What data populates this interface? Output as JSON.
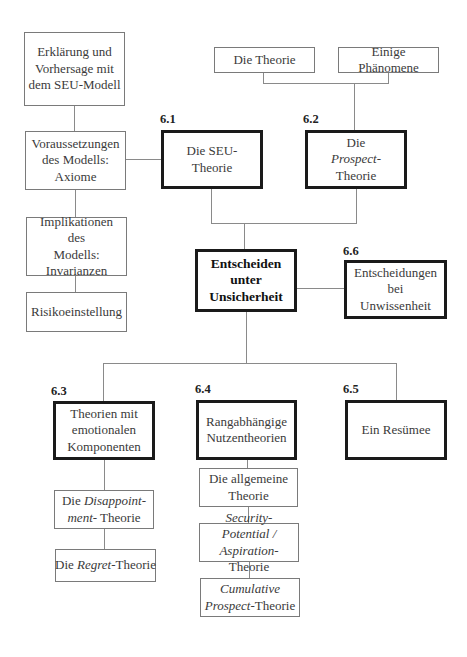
{
  "diagram": {
    "center": {
      "label_lines": [
        "Entscheiden",
        "unter",
        "Unsicherheit"
      ]
    },
    "sections": [
      {
        "number": "6.1",
        "label": "Die SEU-Theorie",
        "subtopics": [
          "Erklärung und Vorhersage mit dem SEU-Modell",
          "Voraussetzungen des Modells: Axiome",
          "Implikationen des Modells: Invarianzen",
          "Risikoeinstellung"
        ]
      },
      {
        "number": "6.2",
        "label_plain_1": "Die",
        "label_italic": "Prospect",
        "label_plain_2": "-Theorie",
        "subtopics": [
          "Die Theorie",
          "Einige Phänomene"
        ]
      },
      {
        "number": "6.3",
        "label": "Theorien mit emotionalen Komponenten",
        "subtopics": [
          "Die Disappointment- Theorie",
          "Die Regret-Theorie"
        ]
      },
      {
        "number": "6.4",
        "label": "Rangabhängige Nutzentheorien",
        "subtopics": [
          "Die allgemeine Theorie",
          "Security-Potential / Aspiration-Theorie",
          "Cumulative Prospect-Theorie"
        ]
      },
      {
        "number": "6.5",
        "label": "Ein Resümee",
        "subtopics": []
      },
      {
        "number": "6.6",
        "label": "Entscheidungen bei Unwissenheit",
        "subtopics": []
      }
    ]
  },
  "text": {
    "erklaerung_1": "Erklärung und",
    "erklaerung_2": "Vorhersage mit",
    "erklaerung_3": "dem SEU-Modell",
    "voraus_1": "Voraussetzungen",
    "voraus_2": "des Modells:",
    "voraus_3": "Axiome",
    "impl_1": "Implikationen des",
    "impl_2": "Modells:",
    "impl_3": "Invarianzen",
    "risiko": "Risikoeinstellung",
    "die_theorie": "Die Theorie",
    "phaenomene": "Einige Phänomene",
    "n61": "6.1",
    "seu": "Die SEU-Theorie",
    "n62": "6.2",
    "prospect_die": "Die",
    "prospect_it": "Prospect",
    "prospect_rest": "-Theorie",
    "center_1": "Entscheiden",
    "center_2": "unter",
    "center_3": "Unsicherheit",
    "n66": "6.6",
    "unwiss_1": "Entscheidungen bei",
    "unwiss_2": "Unwissenheit",
    "n63": "6.3",
    "emo_1": "Theorien mit",
    "emo_2": "emotionalen",
    "emo_3": "Komponenten",
    "n64": "6.4",
    "rang_1": "Rangabhängige",
    "rang_2": "Nutzentheorien",
    "n65": "6.5",
    "resumee": "Ein Resümee",
    "allg_1": "Die allgemeine",
    "allg_2": "Theorie",
    "disap_die": "Die ",
    "disap_it1": "Disappoint-",
    "disap_it2": "ment-",
    "disap_rest": " Theorie",
    "regret_die": "Die ",
    "regret_it": "Regret",
    "regret_rest": "-Theorie",
    "sec_it1": "Security-Potential /",
    "sec_it2": "Aspiration",
    "sec_rest": "-Theorie",
    "cum_it1": "Cumulative",
    "cum_it2": "Prospect",
    "cum_rest": "-Theorie"
  }
}
